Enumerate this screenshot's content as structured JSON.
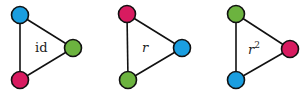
{
  "colors": {
    "blue": "#1a9ee0",
    "green": "#6cb33f",
    "magenta": "#d81b60",
    "edge": "#111111"
  },
  "panels": [
    {
      "label": "id",
      "label_italic": false,
      "label_sup": "",
      "nodes": [
        {
          "position": "top",
          "color": "blue"
        },
        {
          "position": "right",
          "color": "green"
        },
        {
          "position": "bottom",
          "color": "magenta"
        }
      ]
    },
    {
      "label": "r",
      "label_italic": true,
      "label_sup": "",
      "nodes": [
        {
          "position": "top",
          "color": "magenta"
        },
        {
          "position": "right",
          "color": "blue"
        },
        {
          "position": "bottom",
          "color": "green"
        }
      ]
    },
    {
      "label": "r",
      "label_italic": true,
      "label_sup": "2",
      "nodes": [
        {
          "position": "top",
          "color": "green"
        },
        {
          "position": "right",
          "color": "magenta"
        },
        {
          "position": "bottom",
          "color": "blue"
        }
      ]
    }
  ]
}
